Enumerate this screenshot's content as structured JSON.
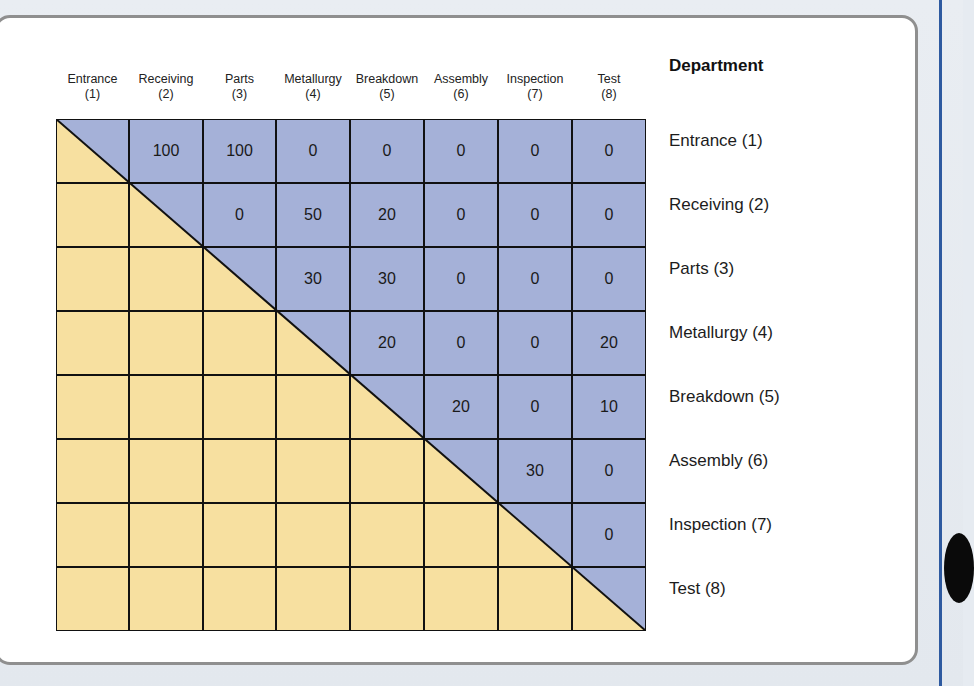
{
  "colors": {
    "upper_fill": "#a5b1d8",
    "lower_fill": "#f7e0a0",
    "grid_line": "#111111",
    "panel_border": "#8f8f8f",
    "accent_rule": "#2e5aa0"
  },
  "matrix": {
    "row_header_title": "Department",
    "columns": [
      {
        "name": "Entrance",
        "num": "(1)"
      },
      {
        "name": "Receiving",
        "num": "(2)"
      },
      {
        "name": "Parts",
        "num": "(3)"
      },
      {
        "name": "Metallurgy",
        "num": "(4)"
      },
      {
        "name": "Breakdown",
        "num": "(5)"
      },
      {
        "name": "Assembly",
        "num": "(6)"
      },
      {
        "name": "Inspection",
        "num": "(7)"
      },
      {
        "name": "Test",
        "num": "(8)"
      }
    ],
    "rows": [
      {
        "label": "Entrance (1)",
        "values": [
          "",
          "100",
          "100",
          "0",
          "0",
          "0",
          "0",
          "0"
        ]
      },
      {
        "label": "Receiving (2)",
        "values": [
          "",
          "",
          "0",
          "50",
          "20",
          "0",
          "0",
          "0"
        ]
      },
      {
        "label": "Parts (3)",
        "values": [
          "",
          "",
          "",
          "30",
          "30",
          "0",
          "0",
          "0"
        ]
      },
      {
        "label": "Metallurgy (4)",
        "values": [
          "",
          "",
          "",
          "",
          "20",
          "0",
          "0",
          "20"
        ]
      },
      {
        "label": "Breakdown (5)",
        "values": [
          "",
          "",
          "",
          "",
          "",
          "20",
          "0",
          "10"
        ]
      },
      {
        "label": "Assembly (6)",
        "values": [
          "",
          "",
          "",
          "",
          "",
          "",
          "30",
          "0"
        ]
      },
      {
        "label": "Inspection (7)",
        "values": [
          "",
          "",
          "",
          "",
          "",
          "",
          "",
          "0"
        ]
      },
      {
        "label": "Test (8)",
        "values": [
          "",
          "",
          "",
          "",
          "",
          "",
          "",
          ""
        ]
      }
    ]
  }
}
